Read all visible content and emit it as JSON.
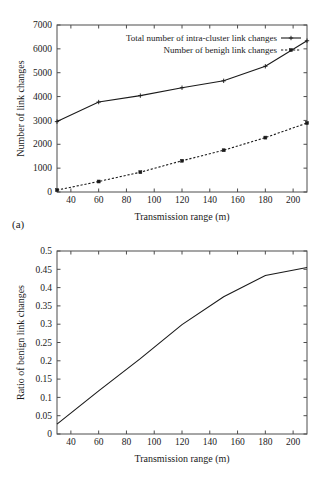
{
  "figure": {
    "panel_a_tag": "(a)",
    "panel_b_tag": "(b)"
  },
  "chart_data": [
    {
      "type": "line",
      "panel": "(a)",
      "title": "",
      "xlabel": "Transmission range (m)",
      "ylabel": "Number of link changes",
      "xlim": [
        30,
        210
      ],
      "ylim": [
        0,
        7000
      ],
      "xticks": [
        40,
        60,
        80,
        100,
        120,
        140,
        160,
        180,
        200
      ],
      "yticks": [
        0,
        1000,
        2000,
        3000,
        4000,
        5000,
        6000,
        7000
      ],
      "xticklabels": [
        "40",
        "60",
        "80",
        "100",
        "120",
        "140",
        "160",
        "180",
        "200"
      ],
      "yticklabels": [
        "0",
        "1000",
        "2000",
        "3000",
        "4000",
        "5000",
        "6000",
        "7000"
      ],
      "grid": false,
      "legend_position": "top-right",
      "x": [
        30,
        60,
        90,
        120,
        150,
        180,
        210
      ],
      "series": [
        {
          "name": "Total number of intra-cluster link changes",
          "style": "solid",
          "marker": "plus",
          "values": [
            2950,
            3770,
            4040,
            4370,
            4660,
            5270,
            6340
          ]
        },
        {
          "name": "Number of benigh link changes",
          "style": "dashed",
          "marker": "square",
          "values": [
            80,
            440,
            830,
            1310,
            1750,
            2280,
            2890
          ]
        }
      ]
    },
    {
      "type": "line",
      "panel": "(b)",
      "title": "",
      "xlabel": "Transmission range (m)",
      "ylabel": "Ratio of benign link changes",
      "xlim": [
        30,
        210
      ],
      "ylim": [
        0,
        0.5
      ],
      "xticks": [
        40,
        60,
        80,
        100,
        120,
        140,
        160,
        180,
        200
      ],
      "yticks": [
        0,
        0.05,
        0.1,
        0.15,
        0.2,
        0.25,
        0.3,
        0.35,
        0.4,
        0.45,
        0.5
      ],
      "xticklabels": [
        "40",
        "60",
        "80",
        "100",
        "120",
        "140",
        "160",
        "180",
        "200"
      ],
      "yticklabels": [
        "0",
        "0.05",
        "0.1",
        "0.15",
        "0.2",
        "0.25",
        "0.3",
        "0.35",
        "0.4",
        "0.45",
        "0.5"
      ],
      "grid": false,
      "legend_position": "none",
      "x": [
        30,
        60,
        90,
        120,
        150,
        180,
        210
      ],
      "series": [
        {
          "name": "Ratio of benign link changes",
          "style": "solid",
          "marker": "none",
          "values": [
            0.027,
            0.118,
            0.206,
            0.299,
            0.375,
            0.433,
            0.455
          ]
        }
      ]
    }
  ]
}
